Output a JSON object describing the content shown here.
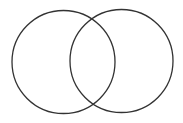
{
  "diagram": {
    "type": "venn",
    "background": "#ffffff",
    "stroke_color": "#333333",
    "circles": [
      {
        "name": "left",
        "cx": 63.5,
        "cy": 62,
        "r": 51.5
      },
      {
        "name": "right",
        "cx": 121.5,
        "cy": 61,
        "r": 51.5
      }
    ]
  }
}
